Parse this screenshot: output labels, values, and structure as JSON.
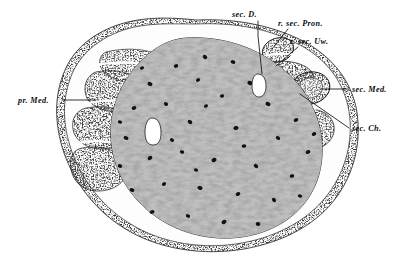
{
  "figure": {
    "kind": "histological-cross-section",
    "caption": "",
    "background_color": "#ffffff",
    "ink_color": "#0d0d0d",
    "width": 414,
    "height": 259
  },
  "labels": [
    {
      "id": "sec-d",
      "text": "sec. D.",
      "text_x": 232,
      "text_y": 17,
      "anchor": "start",
      "leader": "M 258 21 L 258 36 L 262 74",
      "target": "secondary duct lumen"
    },
    {
      "id": "r-sec-pron",
      "text": "r. sec. Pron.",
      "text_x": 278,
      "text_y": 26,
      "anchor": "start",
      "leader": "M 288 29 L 272 49",
      "target": "rudimentary secondary pronephros"
    },
    {
      "id": "r-sec-uw",
      "text": "r. sec. Uw.",
      "text_x": 290,
      "text_y": 44,
      "anchor": "start",
      "leader": "M 298 47 L 276 66",
      "target": "rudimentary secondary Urwirbel"
    },
    {
      "id": "sec-med",
      "text": "sec. Med.",
      "text_x": 352,
      "text_y": 92,
      "anchor": "start",
      "leader": "M 349 89 L 320 89",
      "target": "secondary medullary cord"
    },
    {
      "id": "sec-ch",
      "text": "sec. Ch.",
      "text_x": 352,
      "text_y": 131,
      "anchor": "start",
      "leader": "M 349 128 L 300 94",
      "target": "secondary chorda"
    },
    {
      "id": "pr-med",
      "text": "pr. Med.",
      "text_x": 18,
      "text_y": 103,
      "anchor": "start",
      "leader": "M 62 100 L 96 100",
      "target": "primary medullary cord"
    }
  ],
  "structures": {
    "outer_membrane": "thin speckled epithelial sheath enclosing the whole section",
    "central_mass": "large pale stippled notochordal / central mass with scattered dark nuclei",
    "left_lobes": "dense dark-stippled primary pronephric lobes on the left flank",
    "right_cluster": "secondary pronephric / medullary cluster with ring structures on the right",
    "duct_lumen": "small white duct lumen at upper centre-right",
    "second_lumen": "small white vacuole lumen at left-centre of the central mass"
  }
}
